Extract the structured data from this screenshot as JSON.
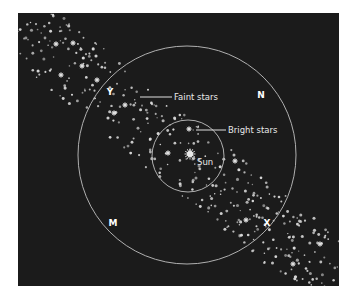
{
  "diagram": {
    "type": "star-field-schematic",
    "colors": {
      "background": "#ffffff",
      "panel": "#1b1b1b",
      "stars": "#d9d9d9",
      "circles": "#b0b0b0",
      "text": "#e8e8e8"
    },
    "panel": {
      "x": 18,
      "y": 13,
      "w": 321,
      "h": 273
    },
    "band": {
      "description": "diagonal band of stars from upper-left to lower-right",
      "start": [
        38,
        38
      ],
      "end": [
        320,
        265
      ],
      "half_width": 34,
      "star_count": 430,
      "seed": 7
    },
    "circles": [
      {
        "name": "outer-circle",
        "cx": 187,
        "cy": 155,
        "r": 109
      },
      {
        "name": "inner-circle",
        "cx": 188,
        "cy": 156,
        "r": 36
      }
    ],
    "sun": {
      "x": 190,
      "y": 154,
      "label": "Sun",
      "label_x": 197,
      "label_y": 165
    },
    "callouts": [
      {
        "name": "faint-stars",
        "label": "Faint stars",
        "line_from": [
          140,
          97
        ],
        "line_to": [
          172,
          97
        ],
        "text_x": 174,
        "text_y": 100
      },
      {
        "name": "bright-stars",
        "label": "Bright stars",
        "line_from": [
          196,
          130
        ],
        "line_to": [
          226,
          130
        ],
        "text_x": 228,
        "text_y": 133
      }
    ],
    "letters": [
      {
        "name": "Y",
        "label": "Y",
        "x": 110,
        "y": 91
      },
      {
        "name": "N",
        "label": "N",
        "x": 261,
        "y": 94
      },
      {
        "name": "M",
        "label": "M",
        "x": 113,
        "y": 222
      },
      {
        "name": "X",
        "label": "X",
        "x": 267,
        "y": 222
      }
    ],
    "bright_stars": [
      [
        56,
        44
      ],
      [
        73,
        43
      ],
      [
        82,
        66
      ],
      [
        97,
        80
      ],
      [
        61,
        75
      ],
      [
        125,
        105
      ],
      [
        114,
        113
      ],
      [
        189,
        129
      ],
      [
        246,
        220
      ],
      [
        320,
        244
      ],
      [
        293,
        264
      ],
      [
        168,
        153
      ],
      [
        235,
        161
      ]
    ]
  }
}
